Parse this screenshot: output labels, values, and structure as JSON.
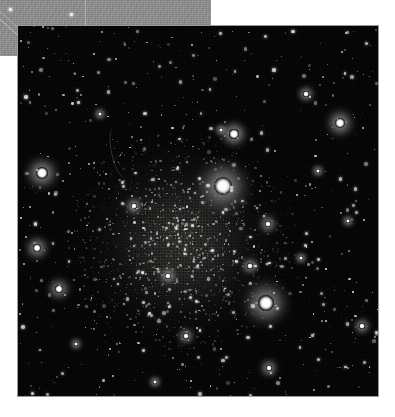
{
  "page": {
    "background_color": "#ffffff",
    "width": 395,
    "height": 417
  },
  "background_band": {
    "name": "gray-header-band",
    "color": "#8d8d8d",
    "x": 0,
    "y": 0,
    "width": 211,
    "height": 56,
    "rule_x": 85,
    "specks": [
      {
        "x": 9,
        "y": 8
      },
      {
        "x": 70,
        "y": 13
      }
    ]
  },
  "plate": {
    "label": "globular-star-cluster",
    "x": 17,
    "y": 25,
    "width": 362,
    "height": 372,
    "background_color": "#040404",
    "border_color": "#9a9a9a",
    "cluster": {
      "center_x": 163,
      "center_y": 216,
      "halo_radius": 118,
      "core_radius": 72
    },
    "filaments": [
      {
        "x": 93,
        "y": 100,
        "width": 16,
        "height": 52,
        "rotate": -12
      }
    ],
    "bright_stars": [
      {
        "x": 205,
        "y": 160,
        "r": 9.0,
        "glow": 17,
        "mag": "brightest"
      },
      {
        "x": 248,
        "y": 277,
        "r": 8.0,
        "glow": 15,
        "mag": "bright"
      },
      {
        "x": 24,
        "y": 147,
        "r": 5.6,
        "glow": 11,
        "mag": "bright"
      },
      {
        "x": 322,
        "y": 97,
        "r": 5.0,
        "glow": 10,
        "mag": "bright"
      },
      {
        "x": 216,
        "y": 108,
        "r": 4.6,
        "glow": 9,
        "mag": "bright"
      },
      {
        "x": 19,
        "y": 222,
        "r": 4.4,
        "glow": 9,
        "mag": "bright"
      },
      {
        "x": 41,
        "y": 263,
        "r": 4.2,
        "glow": 8,
        "mag": "bright"
      },
      {
        "x": 250,
        "y": 198,
        "r": 3.4,
        "glow": 7,
        "mag": "medium"
      },
      {
        "x": 251,
        "y": 342,
        "r": 3.2,
        "glow": 7,
        "mag": "medium"
      },
      {
        "x": 288,
        "y": 68,
        "r": 3.0,
        "glow": 6,
        "mag": "medium"
      },
      {
        "x": 344,
        "y": 300,
        "r": 2.8,
        "glow": 6,
        "mag": "medium"
      },
      {
        "x": 168,
        "y": 310,
        "r": 2.8,
        "glow": 6,
        "mag": "medium"
      },
      {
        "x": 232,
        "y": 240,
        "r": 2.6,
        "glow": 6,
        "mag": "medium"
      },
      {
        "x": 150,
        "y": 250,
        "r": 2.6,
        "glow": 6,
        "mag": "medium"
      },
      {
        "x": 116,
        "y": 180,
        "r": 2.6,
        "glow": 6,
        "mag": "medium"
      },
      {
        "x": 203,
        "y": 104,
        "r": 2.4,
        "glow": 5,
        "mag": "medium"
      },
      {
        "x": 330,
        "y": 195,
        "r": 2.4,
        "glow": 5,
        "mag": "medium"
      },
      {
        "x": 82,
        "y": 88,
        "r": 2.4,
        "glow": 5,
        "mag": "medium"
      },
      {
        "x": 137,
        "y": 356,
        "r": 2.4,
        "glow": 5,
        "mag": "medium"
      },
      {
        "x": 300,
        "y": 145,
        "r": 2.2,
        "glow": 5,
        "mag": "medium"
      },
      {
        "x": 58,
        "y": 318,
        "r": 2.2,
        "glow": 5,
        "mag": "medium"
      },
      {
        "x": 283,
        "y": 232,
        "r": 2.2,
        "glow": 5,
        "mag": "medium"
      }
    ]
  }
}
